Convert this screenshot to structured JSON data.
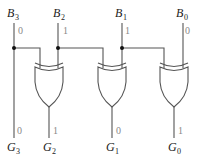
{
  "diagram": {
    "type": "binary-to-gray-converter",
    "inputs": [
      {
        "name": "B",
        "sub": "3",
        "value": "0"
      },
      {
        "name": "B",
        "sub": "2",
        "value": "1"
      },
      {
        "name": "B",
        "sub": "1",
        "value": "1"
      },
      {
        "name": "B",
        "sub": "0",
        "value": "0"
      }
    ],
    "outputs": [
      {
        "name": "G",
        "sub": "3",
        "value": "0"
      },
      {
        "name": "G",
        "sub": "2",
        "value": "1"
      },
      {
        "name": "G",
        "sub": "1",
        "value": "0"
      },
      {
        "name": "G",
        "sub": "0",
        "value": "1"
      }
    ],
    "gates": [
      {
        "type": "XOR",
        "inputs": [
          "B3",
          "B2"
        ],
        "output": "G2"
      },
      {
        "type": "XOR",
        "inputs": [
          "B2",
          "B1"
        ],
        "output": "G1"
      },
      {
        "type": "XOR",
        "inputs": [
          "B1",
          "B0"
        ],
        "output": "G0"
      }
    ],
    "colors": {
      "wire": "#555555",
      "junction": "#111111",
      "bit_value": "#888888"
    }
  }
}
